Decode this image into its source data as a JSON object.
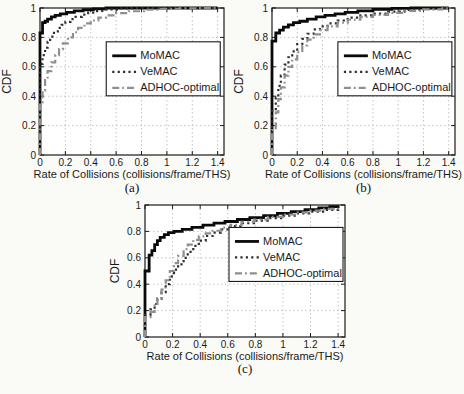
{
  "figure": {
    "background": "#fafaf7",
    "plot_background": "#ffffff",
    "axis_color": "#1a1a1a",
    "grid_color": "#c4c4c4",
    "text_color": "#1a1a1a"
  },
  "chart_data": [
    {
      "type": "line",
      "subtype": "cdf-step",
      "caption": "(a)",
      "xlabel": "Rate of Collisions (collisions/frame/THS)",
      "ylabel": "CDF",
      "xlim": [
        0,
        1.45
      ],
      "ylim": [
        0,
        1
      ],
      "xticks": [
        0,
        0.2,
        0.4,
        0.6,
        0.8,
        1,
        1.2,
        1.4
      ],
      "yticks": [
        0,
        0.2,
        0.4,
        0.6,
        0.8,
        1
      ],
      "grid": true,
      "legend_position": {
        "fx": 0.36,
        "fy": 0.23
      },
      "series": [
        {
          "name": "MoMAC",
          "style": "solid",
          "color": "#0a0a0a",
          "width": 2.8,
          "points": [
            [
              0,
              0
            ],
            [
              0,
              0.83
            ],
            [
              0.02,
              0.83
            ],
            [
              0.02,
              0.9
            ],
            [
              0.04,
              0.91
            ],
            [
              0.06,
              0.925
            ],
            [
              0.09,
              0.94
            ],
            [
              0.12,
              0.95
            ],
            [
              0.16,
              0.96
            ],
            [
              0.21,
              0.97
            ],
            [
              0.27,
              0.98
            ],
            [
              0.34,
              0.988
            ],
            [
              0.42,
              0.994
            ],
            [
              0.52,
              1.0
            ],
            [
              1.4,
              1.0
            ]
          ]
        },
        {
          "name": "VeMAC",
          "style": "dotted",
          "color": "#2e2e2e",
          "width": 2.2,
          "points": [
            [
              0,
              0
            ],
            [
              0,
              0.62
            ],
            [
              0.02,
              0.68
            ],
            [
              0.04,
              0.73
            ],
            [
              0.06,
              0.77
            ],
            [
              0.08,
              0.805
            ],
            [
              0.11,
              0.84
            ],
            [
              0.14,
              0.865
            ],
            [
              0.17,
              0.885
            ],
            [
              0.2,
              0.905
            ],
            [
              0.24,
              0.925
            ],
            [
              0.28,
              0.94
            ],
            [
              0.33,
              0.955
            ],
            [
              0.38,
              0.968
            ],
            [
              0.45,
              0.98
            ],
            [
              0.52,
              0.99
            ],
            [
              0.62,
              0.997
            ],
            [
              0.72,
              1.0
            ],
            [
              1.4,
              1.0
            ]
          ]
        },
        {
          "name": "ADHOC-optimal",
          "style": "dashdot",
          "color": "#8f8f8f",
          "width": 2.2,
          "points": [
            [
              0,
              0
            ],
            [
              0,
              0.35
            ],
            [
              0.02,
              0.44
            ],
            [
              0.04,
              0.51
            ],
            [
              0.06,
              0.57
            ],
            [
              0.09,
              0.63
            ],
            [
              0.12,
              0.68
            ],
            [
              0.15,
              0.72
            ],
            [
              0.18,
              0.76
            ],
            [
              0.22,
              0.8
            ],
            [
              0.26,
              0.835
            ],
            [
              0.3,
              0.865
            ],
            [
              0.35,
              0.895
            ],
            [
              0.4,
              0.915
            ],
            [
              0.46,
              0.935
            ],
            [
              0.52,
              0.95
            ],
            [
              0.6,
              0.965
            ],
            [
              0.7,
              0.978
            ],
            [
              0.82,
              0.988
            ],
            [
              0.95,
              0.994
            ],
            [
              1.1,
              0.998
            ],
            [
              1.25,
              1.0
            ],
            [
              1.4,
              1.0
            ]
          ]
        }
      ]
    },
    {
      "type": "line",
      "subtype": "cdf-step",
      "caption": "(b)",
      "xlabel": "Rate of Collisions (collisions/frame/THS)",
      "ylabel": "CDF",
      "xlim": [
        0,
        1.45
      ],
      "ylim": [
        0,
        1
      ],
      "xticks": [
        0,
        0.2,
        0.4,
        0.6,
        0.8,
        1,
        1.2,
        1.4
      ],
      "yticks": [
        0,
        0.2,
        0.4,
        0.6,
        0.8,
        1
      ],
      "grid": true,
      "legend_position": {
        "fx": 0.36,
        "fy": 0.23
      },
      "series": [
        {
          "name": "MoMAC",
          "style": "solid",
          "color": "#0a0a0a",
          "width": 2.8,
          "points": [
            [
              0,
              0
            ],
            [
              0,
              0.775
            ],
            [
              0.03,
              0.775
            ],
            [
              0.03,
              0.83
            ],
            [
              0.06,
              0.85
            ],
            [
              0.09,
              0.87
            ],
            [
              0.13,
              0.885
            ],
            [
              0.17,
              0.9
            ],
            [
              0.22,
              0.91
            ],
            [
              0.28,
              0.925
            ],
            [
              0.35,
              0.94
            ],
            [
              0.42,
              0.95
            ],
            [
              0.5,
              0.96
            ],
            [
              0.58,
              0.97
            ],
            [
              0.68,
              0.98
            ],
            [
              0.8,
              0.99
            ],
            [
              0.95,
              0.997
            ],
            [
              1.1,
              1.0
            ],
            [
              1.4,
              1.0
            ]
          ]
        },
        {
          "name": "VeMAC",
          "style": "dotted",
          "color": "#2e2e2e",
          "width": 2.2,
          "points": [
            [
              0,
              0
            ],
            [
              0,
              0.3
            ],
            [
              0.03,
              0.39
            ],
            [
              0.05,
              0.47
            ],
            [
              0.07,
              0.54
            ],
            [
              0.1,
              0.615
            ],
            [
              0.13,
              0.665
            ],
            [
              0.16,
              0.705
            ],
            [
              0.2,
              0.755
            ],
            [
              0.24,
              0.79
            ],
            [
              0.28,
              0.825
            ],
            [
              0.33,
              0.855
            ],
            [
              0.38,
              0.875
            ],
            [
              0.44,
              0.895
            ],
            [
              0.52,
              0.915
            ],
            [
              0.6,
              0.935
            ],
            [
              0.7,
              0.95
            ],
            [
              0.8,
              0.962
            ],
            [
              0.92,
              0.975
            ],
            [
              1.05,
              0.987
            ],
            [
              1.2,
              0.995
            ],
            [
              1.35,
              1.0
            ],
            [
              1.4,
              1.0
            ]
          ]
        },
        {
          "name": "ADHOC-optimal",
          "style": "dashdot",
          "color": "#8f8f8f",
          "width": 2.2,
          "points": [
            [
              0,
              0
            ],
            [
              0,
              0.17
            ],
            [
              0.03,
              0.29
            ],
            [
              0.05,
              0.38
            ],
            [
              0.07,
              0.46
            ],
            [
              0.1,
              0.54
            ],
            [
              0.13,
              0.6
            ],
            [
              0.16,
              0.65
            ],
            [
              0.2,
              0.7
            ],
            [
              0.24,
              0.745
            ],
            [
              0.28,
              0.785
            ],
            [
              0.33,
              0.82
            ],
            [
              0.38,
              0.85
            ],
            [
              0.44,
              0.875
            ],
            [
              0.52,
              0.9
            ],
            [
              0.6,
              0.92
            ],
            [
              0.7,
              0.94
            ],
            [
              0.8,
              0.953
            ],
            [
              0.92,
              0.967
            ],
            [
              1.05,
              0.98
            ],
            [
              1.2,
              0.99
            ],
            [
              1.35,
              0.998
            ],
            [
              1.4,
              1.0
            ]
          ]
        }
      ]
    },
    {
      "type": "line",
      "subtype": "cdf-step",
      "caption": "(c)",
      "xlabel": "Rate of Collisions (collisions/frame/THS)",
      "ylabel": "CDF",
      "xlim": [
        0,
        1.45
      ],
      "ylim": [
        0,
        1
      ],
      "xticks": [
        0,
        0.2,
        0.4,
        0.6,
        0.8,
        1,
        1.2,
        1.4
      ],
      "yticks": [
        0,
        0.2,
        0.4,
        0.6,
        0.8,
        1
      ],
      "grid": true,
      "legend_position": {
        "fx": 0.42,
        "fy": 0.17
      },
      "series": [
        {
          "name": "MoMAC",
          "style": "solid",
          "color": "#0a0a0a",
          "width": 2.8,
          "points": [
            [
              0,
              0
            ],
            [
              0,
              0.5
            ],
            [
              0.03,
              0.5
            ],
            [
              0.03,
              0.62
            ],
            [
              0.05,
              0.655
            ],
            [
              0.07,
              0.7
            ],
            [
              0.09,
              0.73
            ],
            [
              0.11,
              0.755
            ],
            [
              0.14,
              0.775
            ],
            [
              0.17,
              0.79
            ],
            [
              0.21,
              0.8
            ],
            [
              0.27,
              0.815
            ],
            [
              0.34,
              0.83
            ],
            [
              0.42,
              0.848
            ],
            [
              0.5,
              0.862
            ],
            [
              0.58,
              0.875
            ],
            [
              0.67,
              0.89
            ],
            [
              0.76,
              0.905
            ],
            [
              0.86,
              0.92
            ],
            [
              0.96,
              0.936
            ],
            [
              1.06,
              0.95
            ],
            [
              1.16,
              0.964
            ],
            [
              1.26,
              0.978
            ],
            [
              1.34,
              0.988
            ],
            [
              1.4,
              0.995
            ]
          ]
        },
        {
          "name": "VeMAC",
          "style": "dotted",
          "color": "#2e2e2e",
          "width": 2.2,
          "points": [
            [
              0,
              0
            ],
            [
              0,
              0.17
            ],
            [
              0.04,
              0.21
            ],
            [
              0.07,
              0.25
            ],
            [
              0.09,
              0.29
            ],
            [
              0.12,
              0.34
            ],
            [
              0.15,
              0.4
            ],
            [
              0.18,
              0.46
            ],
            [
              0.21,
              0.51
            ],
            [
              0.24,
              0.55
            ],
            [
              0.28,
              0.6
            ],
            [
              0.31,
              0.645
            ],
            [
              0.35,
              0.69
            ],
            [
              0.39,
              0.73
            ],
            [
              0.44,
              0.765
            ],
            [
              0.49,
              0.79
            ],
            [
              0.55,
              0.815
            ],
            [
              0.62,
              0.84
            ],
            [
              0.7,
              0.862
            ],
            [
              0.79,
              0.882
            ],
            [
              0.89,
              0.9
            ],
            [
              1.0,
              0.92
            ],
            [
              1.1,
              0.936
            ],
            [
              1.2,
              0.95
            ],
            [
              1.3,
              0.962
            ],
            [
              1.4,
              0.972
            ]
          ]
        },
        {
          "name": "ADHOC-optimal",
          "style": "dashdot",
          "color": "#8f8f8f",
          "width": 2.2,
          "points": [
            [
              0,
              0
            ],
            [
              0,
              0.15
            ],
            [
              0.04,
              0.19
            ],
            [
              0.07,
              0.24
            ],
            [
              0.09,
              0.29
            ],
            [
              0.12,
              0.36
            ],
            [
              0.15,
              0.43
            ],
            [
              0.18,
              0.5
            ],
            [
              0.21,
              0.56
            ],
            [
              0.24,
              0.615
            ],
            [
              0.28,
              0.665
            ],
            [
              0.31,
              0.7
            ],
            [
              0.35,
              0.735
            ],
            [
              0.39,
              0.762
            ],
            [
              0.44,
              0.785
            ],
            [
              0.49,
              0.805
            ],
            [
              0.55,
              0.828
            ],
            [
              0.62,
              0.85
            ],
            [
              0.7,
              0.872
            ],
            [
              0.79,
              0.89
            ],
            [
              0.89,
              0.91
            ],
            [
              1.0,
              0.928
            ],
            [
              1.1,
              0.944
            ],
            [
              1.2,
              0.958
            ],
            [
              1.3,
              0.97
            ],
            [
              1.4,
              0.98
            ]
          ]
        }
      ]
    }
  ]
}
